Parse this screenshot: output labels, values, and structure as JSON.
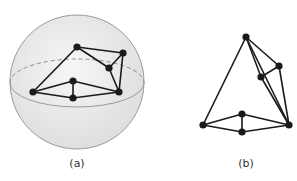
{
  "figure": {
    "panels": [
      {
        "id": "a",
        "label": "(a)",
        "description": "Planar graph drawn on a sphere",
        "nodes": [
          "top",
          "top-right",
          "mid-right",
          "left",
          "center-top",
          "center-bottom",
          "right"
        ],
        "edges": [
          [
            "top",
            "left"
          ],
          [
            "top",
            "top-right"
          ],
          [
            "top",
            "mid-right"
          ],
          [
            "top-right",
            "mid-right"
          ],
          [
            "top-right",
            "right"
          ],
          [
            "mid-right",
            "right"
          ],
          [
            "left",
            "center-top"
          ],
          [
            "left",
            "center-bottom"
          ],
          [
            "center-top",
            "center-bottom"
          ],
          [
            "center-top",
            "right"
          ],
          [
            "center-bottom",
            "right"
          ]
        ]
      },
      {
        "id": "b",
        "label": "(b)",
        "description": "Same graph drawn in the plane",
        "nodes": [
          "top",
          "upper-right",
          "mid",
          "left",
          "center-top",
          "center-bottom",
          "right"
        ],
        "edges": [
          [
            "top",
            "left"
          ],
          [
            "top",
            "right"
          ],
          [
            "top",
            "mid"
          ],
          [
            "top",
            "upper-right"
          ],
          [
            "upper-right",
            "mid"
          ],
          [
            "upper-right",
            "right"
          ],
          [
            "mid",
            "right"
          ],
          [
            "left",
            "center-top"
          ],
          [
            "left",
            "center-bottom"
          ],
          [
            "center-top",
            "center-bottom"
          ],
          [
            "center-top",
            "right"
          ],
          [
            "center-bottom",
            "right"
          ]
        ]
      }
    ],
    "colors": {
      "edge": "#1a1a1a",
      "node": "#1a1a1a",
      "sphere_outline": "#9a9a9a",
      "sphere_fill": "#ececec"
    }
  }
}
